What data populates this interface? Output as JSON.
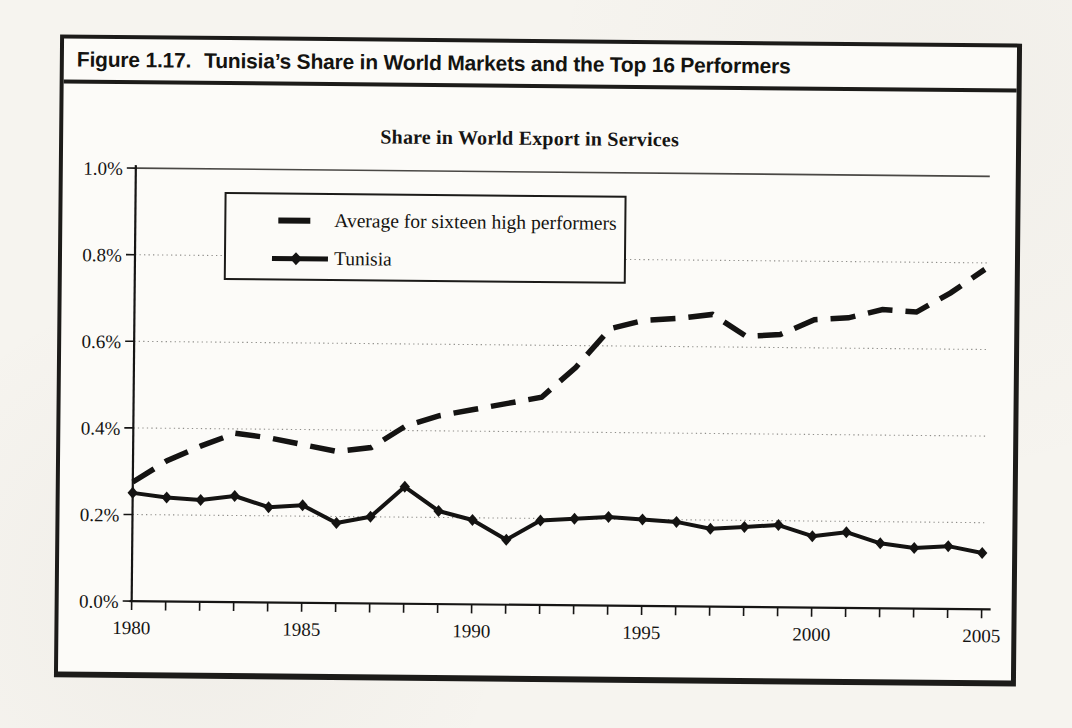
{
  "figure": {
    "label": "Figure 1.17.",
    "title": "Tunisia’s Share in World Markets and the Top 16 Performers"
  },
  "chart_data": {
    "type": "line",
    "title": "Share in World Export in Services",
    "x": [
      1980,
      1981,
      1982,
      1983,
      1984,
      1985,
      1986,
      1987,
      1988,
      1989,
      1990,
      1991,
      1992,
      1993,
      1994,
      1995,
      1996,
      1997,
      1998,
      1999,
      2000,
      2001,
      2002,
      2003,
      2004,
      2005
    ],
    "x_tick_labels": [
      "1980",
      "1985",
      "1990",
      "1995",
      "2000",
      "2005"
    ],
    "y_ticks": [
      {
        "label": "0.0%",
        "value": 0.0
      },
      {
        "label": "0.2%",
        "value": 0.2
      },
      {
        "label": "0.4%",
        "value": 0.4
      },
      {
        "label": "0.6%",
        "value": 0.6
      },
      {
        "label": "0.8%",
        "value": 0.8
      },
      {
        "label": "1.0%",
        "value": 1.0
      }
    ],
    "ylim": [
      0.0,
      1.0
    ],
    "y_unit": "percent share",
    "grid": "dotted-horizontal",
    "legend_position": "top-left-inside",
    "line_color": "#141312",
    "series": [
      {
        "name": "Average for sixteen high performers",
        "style": "dashed",
        "marker": "none",
        "color": "#141312",
        "values": [
          0.275,
          0.325,
          0.36,
          0.39,
          0.38,
          0.365,
          0.35,
          0.36,
          0.41,
          0.435,
          0.45,
          0.465,
          0.48,
          0.55,
          0.64,
          0.66,
          0.665,
          0.675,
          0.625,
          0.63,
          0.665,
          0.67,
          0.69,
          0.685,
          0.73,
          0.785
        ]
      },
      {
        "name": "Tunisia",
        "style": "solid",
        "marker": "diamond",
        "color": "#141312",
        "values": [
          0.25,
          0.24,
          0.235,
          0.245,
          0.22,
          0.225,
          0.185,
          0.2,
          0.27,
          0.215,
          0.195,
          0.15,
          0.195,
          0.2,
          0.205,
          0.2,
          0.195,
          0.18,
          0.185,
          0.19,
          0.165,
          0.175,
          0.15,
          0.14,
          0.145,
          0.13
        ]
      }
    ]
  }
}
